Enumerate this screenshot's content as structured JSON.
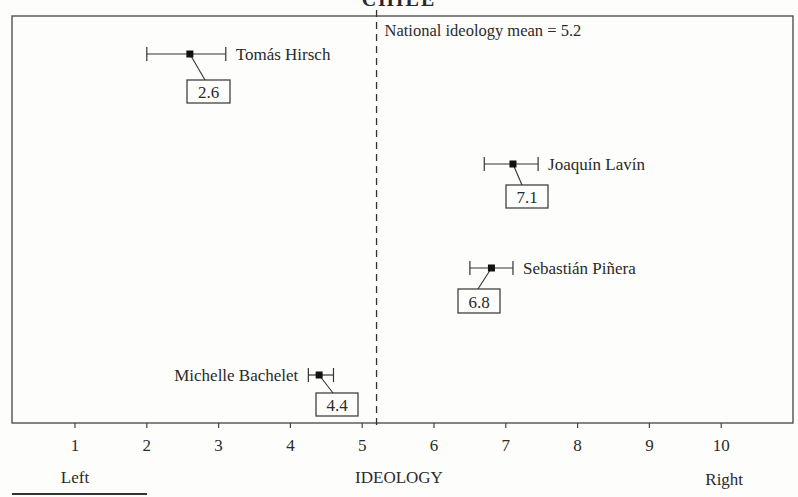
{
  "chart_data": {
    "type": "scatter",
    "title": "CHILE",
    "xlabel": "IDEOLOGY",
    "xlabel_left": "Left",
    "xlabel_right": "Right",
    "xlim": [
      0.1,
      10.9
    ],
    "xticks": [
      1,
      2,
      3,
      4,
      5,
      6,
      7,
      8,
      9,
      10
    ],
    "grid": false,
    "reference_line": {
      "value": 5.2,
      "label": "National ideology mean = 5.2",
      "style": "dashed"
    },
    "points": [
      {
        "name": "Tomás Hirsch",
        "value": 2.6,
        "ci_low": 2.0,
        "ci_high": 3.1,
        "label": "2.6",
        "name_side": "right"
      },
      {
        "name": "Joaquín Lavín",
        "value": 7.1,
        "ci_low": 6.7,
        "ci_high": 7.45,
        "label": "7.1",
        "name_side": "right"
      },
      {
        "name": "Sebastián Piñera",
        "value": 6.8,
        "ci_low": 6.5,
        "ci_high": 7.1,
        "label": "6.8",
        "name_side": "right"
      },
      {
        "name": "Michelle Bachelet",
        "value": 4.4,
        "ci_low": 4.25,
        "ci_high": 4.6,
        "label": "4.4",
        "name_side": "left"
      }
    ]
  }
}
